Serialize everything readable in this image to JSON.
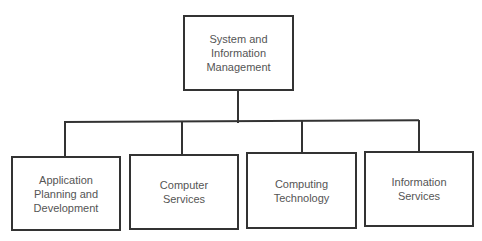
{
  "diagram": {
    "type": "org-chart",
    "root": {
      "label": "System and\nInformation\nManagement"
    },
    "children": [
      {
        "label": "Application\nPlanning and\nDevelopment"
      },
      {
        "label": "Computer\nServices"
      },
      {
        "label": "Computing\nTechnology"
      },
      {
        "label": "Information\nServices"
      }
    ]
  }
}
